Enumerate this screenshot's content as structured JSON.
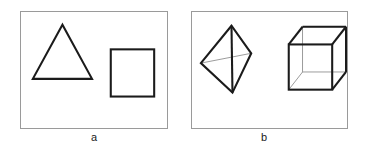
{
  "figure": {
    "caption_a": "a",
    "caption_b": "b",
    "panel_a_name": "two-dimensional-shapes-panel",
    "panel_b_name": "three-dimensional-shapes-panel",
    "colors": {
      "panel_border": "#9a9a9a",
      "edge_visible": "#1b1b1b",
      "edge_hidden": "#8f8f8f",
      "background": "#ffffff",
      "caption_text": "#1a1a1a"
    }
  },
  "chart_data": {
    "type": "diagram",
    "title": "",
    "panels": [
      {
        "label": "a",
        "description": "Two-dimensional outline shapes",
        "shapes": [
          {
            "name": "triangle",
            "kind": "polygon",
            "dimension": "2D",
            "vertices": [
              [
                42,
                13
              ],
              [
                12,
                68
              ],
              [
                72,
                68
              ]
            ],
            "closed": true,
            "filled": false
          },
          {
            "name": "square",
            "kind": "rectangle",
            "dimension": "2D",
            "x": 91,
            "y": 38,
            "width": 44,
            "height": 48,
            "filled": false
          }
        ]
      },
      {
        "label": "b",
        "description": "Three-dimensional wireframe solids",
        "shapes": [
          {
            "name": "tetrahedron",
            "kind": "wireframe",
            "dimension": "3D",
            "vertices": {
              "apex": [
                40,
                14
              ],
              "left": [
                9,
                52
              ],
              "right": [
                60,
                42
              ],
              "bottom": [
                41,
                82
              ]
            },
            "visible_edges": [
              [
                "apex",
                "left"
              ],
              [
                "apex",
                "right"
              ],
              [
                "apex",
                "bottom"
              ],
              [
                "left",
                "bottom"
              ],
              [
                "right",
                "bottom"
              ]
            ],
            "hidden_edges": [
              [
                "left",
                "right"
              ]
            ]
          },
          {
            "name": "cube",
            "kind": "wireframe",
            "dimension": "3D",
            "front_face": {
              "x": 98,
              "y": 33,
              "width": 44,
              "height": 46
            },
            "depth_offset": [
              14,
              -18
            ],
            "visible_edges_count": 9,
            "hidden_edges_count": 3
          }
        ]
      }
    ]
  }
}
